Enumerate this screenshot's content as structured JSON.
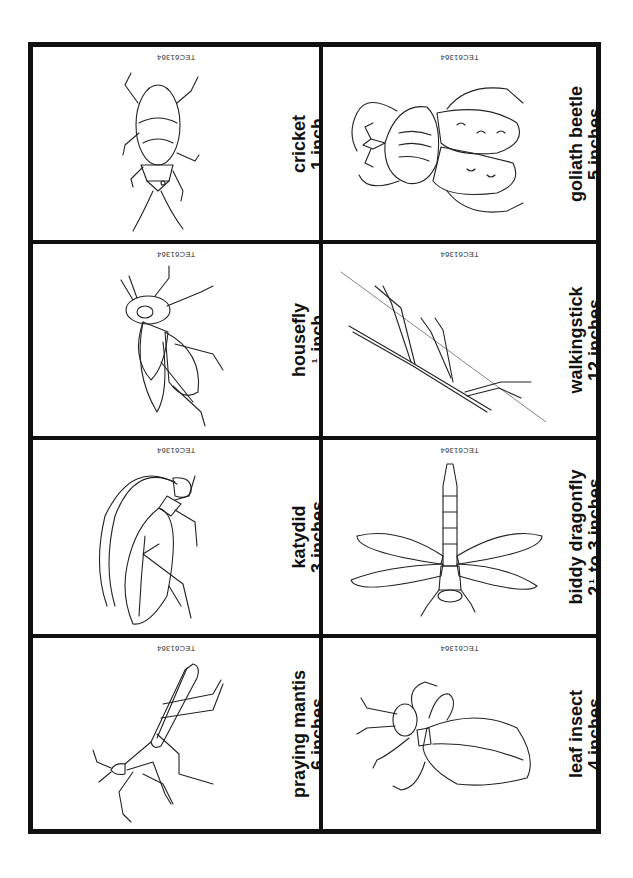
{
  "sheet": {
    "code": "TEC61364",
    "border_color": "#111111",
    "background": "#ffffff"
  },
  "cards": {
    "cricket": {
      "name": "cricket",
      "size": "1 inch",
      "code": "TEC61364"
    },
    "housefly": {
      "name": "housefly",
      "size_fraction_num": "1",
      "size_fraction_den": "2",
      "size_unit": "inch",
      "code": "TEC61364"
    },
    "katydid": {
      "name": "katydid",
      "size": "3 inches",
      "code": "TEC61364"
    },
    "praying_mantis": {
      "name": "praying mantis",
      "size": "6 inches",
      "code": "TEC61364"
    },
    "goliath_beetle": {
      "name": "goliath beetle",
      "size": "5 inches",
      "code": "TEC61364"
    },
    "walkingstick": {
      "name": "walkingstick",
      "size": "12 inches",
      "code": "TEC61364"
    },
    "biddy_dragonfly": {
      "name": "biddy  dragonfly",
      "size_whole": "2",
      "size_fraction_num": "1",
      "size_fraction_den": "2",
      "size_rest": "to 3 inches",
      "code": "TEC61364"
    },
    "leaf_insect": {
      "name": "leaf insect",
      "size": "4 inches",
      "code": "TEC61364"
    }
  }
}
